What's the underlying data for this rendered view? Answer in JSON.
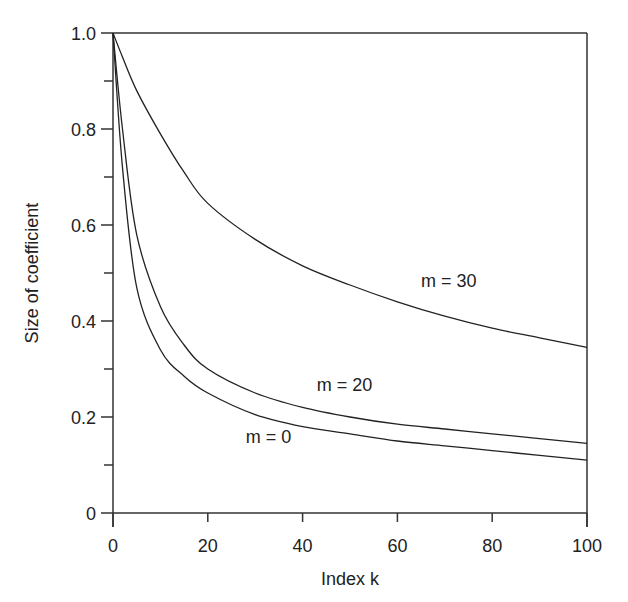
{
  "chart_data": {
    "type": "line",
    "title": "",
    "xlabel": "Index k",
    "ylabel": "Size of coefficient",
    "xlim": [
      0,
      100
    ],
    "ylim": [
      0,
      1.0
    ],
    "xticks": [
      "0",
      "20",
      "40",
      "60",
      "80",
      "100"
    ],
    "yticks": [
      "0",
      "0.2",
      "0.4",
      "0.6",
      "0.8",
      "1.0"
    ],
    "grid": false,
    "legend": "inline labels",
    "x": [
      0,
      2,
      5,
      10,
      15,
      20,
      30,
      40,
      50,
      60,
      70,
      80,
      90,
      100
    ],
    "series": [
      {
        "name": "m = 30",
        "values": [
          1.0,
          0.95,
          0.88,
          0.79,
          0.71,
          0.645,
          0.57,
          0.515,
          0.475,
          0.44,
          0.41,
          0.385,
          0.365,
          0.345
        ]
      },
      {
        "name": "m = 20",
        "values": [
          1.0,
          0.8,
          0.58,
          0.43,
          0.35,
          0.3,
          0.25,
          0.22,
          0.2,
          0.185,
          0.175,
          0.165,
          0.155,
          0.145
        ]
      },
      {
        "name": "m = 0",
        "values": [
          1.0,
          0.72,
          0.47,
          0.34,
          0.285,
          0.25,
          0.205,
          0.18,
          0.165,
          0.15,
          0.14,
          0.13,
          0.12,
          0.11
        ]
      }
    ],
    "annotations": [
      {
        "text": "m = 30",
        "x": 65,
        "y": 0.47
      },
      {
        "text": "m = 20",
        "x": 43,
        "y": 0.255
      },
      {
        "text": "m = 0",
        "x": 28,
        "y": 0.145
      }
    ]
  }
}
